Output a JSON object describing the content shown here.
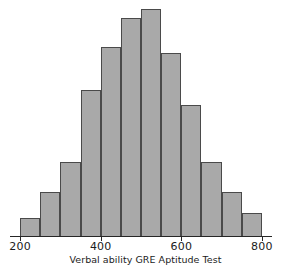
{
  "chart_data": {
    "type": "bar",
    "title": "",
    "subtitle": "",
    "xlabel": "Verbal ability GRE Aptitude Test",
    "ylabel": "",
    "grid": false,
    "legend": null,
    "xlim": [
      175,
      825
    ],
    "ylim": [
      0,
      240
    ],
    "bin_width": 50,
    "axis_tick_values": [
      200,
      400,
      600,
      800
    ],
    "axis_tick_labels": [
      "200",
      "400",
      "600",
      "800"
    ],
    "categories": [
      "200-250",
      "250-300",
      "300-350",
      "350-400",
      "400-450",
      "450-500",
      "500-550",
      "550-600",
      "600-650",
      "650-700",
      "700-750",
      "750-800"
    ],
    "bin_starts": [
      200,
      250,
      300,
      350,
      400,
      450,
      500,
      550,
      600,
      650,
      700,
      750
    ],
    "values": [
      19,
      46,
      76,
      149,
      193,
      223,
      232,
      187,
      134,
      76,
      46,
      24
    ],
    "bar_fill_color": "#a9a9a9",
    "bar_edge_color": "#4a4a4a",
    "axis_color": "#262626",
    "background_color": "#ffffff"
  },
  "figure": {
    "caption": "Verbal ability GRE Aptitude Test"
  }
}
